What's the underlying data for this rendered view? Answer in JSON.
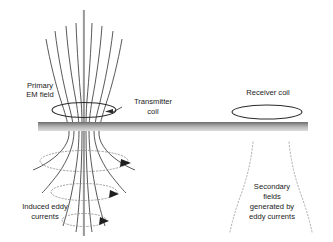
{
  "figure": {
    "type": "schematic-diagram",
    "background_color": "#ffffff",
    "line_color": "#333333",
    "ground_color_top": "#6e6e6e",
    "ground_color_bottom": "#d9d9d9",
    "dotted_color": "#8a8a8a",
    "axis_color": "#999999"
  },
  "labels": {
    "primary_em_field": {
      "lines": [
        "Primary",
        "EM field"
      ],
      "x": 40,
      "y": 88
    },
    "transmitter_coil": {
      "lines": [
        "Transmitter",
        "coil"
      ],
      "x": 153,
      "y": 104
    },
    "receiver_coil": {
      "lines": [
        "Receiver coil"
      ],
      "x": 268,
      "y": 95
    },
    "induced_eddy_currents": {
      "lines": [
        "Induced eddy",
        "currents"
      ],
      "x": 45,
      "y": 209
    },
    "secondary_fields": {
      "lines": [
        "Secondary",
        "fields",
        "generated by",
        "eddy currents"
      ],
      "x": 272,
      "y": 189
    }
  },
  "elements": {
    "transmitter_coil_ellipse": {
      "cx": 84,
      "cy": 110,
      "rx": 32,
      "ry": 7.5
    },
    "receiver_coil_ellipse": {
      "cx": 267,
      "cy": 112,
      "rx": 35,
      "ry": 7
    },
    "ground_band": {
      "x": 38,
      "y": 122,
      "width": 270,
      "height": 9
    },
    "eddy_current_loops": [
      {
        "cx": 84,
        "cy": 161,
        "rx": 44,
        "ry": 10.5
      },
      {
        "cx": 84,
        "cy": 192,
        "rx": 33,
        "ry": 8.5
      },
      {
        "cx": 84,
        "cy": 220,
        "rx": 22,
        "ry": 6.5
      }
    ],
    "center_axis": {
      "x": 84,
      "y_top": 10,
      "y_bottom": 236
    },
    "primary_field_line_count": 7,
    "secondary_field_curve_count": 2
  }
}
